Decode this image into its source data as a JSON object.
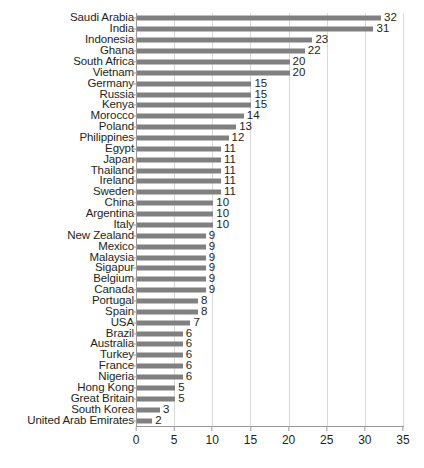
{
  "chart_data": {
    "type": "bar",
    "orientation": "horizontal",
    "title": "",
    "subtitle": "",
    "xlabel": "",
    "ylabel": "",
    "xlim": [
      0,
      35
    ],
    "xticks": [
      0,
      5,
      10,
      15,
      20,
      25,
      30,
      35
    ],
    "grid": true,
    "grid_axis": "x",
    "legend": false,
    "legend_position": "none",
    "bar_color": "#808080",
    "grid_color": "#d9d9d9",
    "axis_color": "#9a9a9a",
    "text_color": "#231f20",
    "data_labels": true,
    "categories": [
      "Saudi Arabia",
      "India",
      "Indonesia",
      "Ghana",
      "South Africa",
      "Vietnam",
      "Germany",
      "Russia",
      "Kenya",
      "Morocco",
      "Poland",
      "Philippines",
      "Egypt",
      "Japan",
      "Thailand",
      "Ireland",
      "Sweden",
      "China",
      "Argentina",
      "Italy",
      "New Zealand",
      "Mexico",
      "Malaysia",
      "Sigapur",
      "Belgium",
      "Canada",
      "Portugal",
      "Spain",
      "USA",
      "Brazil",
      "Australia",
      "Turkey",
      "France",
      "Nigeria",
      "Hong Kong",
      "Great Britain",
      "South Korea",
      "United Arab Emirates"
    ],
    "values": [
      32,
      31,
      23,
      22,
      20,
      20,
      15,
      15,
      15,
      14,
      13,
      12,
      11,
      11,
      11,
      11,
      11,
      10,
      10,
      10,
      9,
      9,
      9,
      9,
      9,
      9,
      8,
      8,
      7,
      6,
      6,
      6,
      6,
      6,
      5,
      5,
      3,
      2
    ]
  }
}
